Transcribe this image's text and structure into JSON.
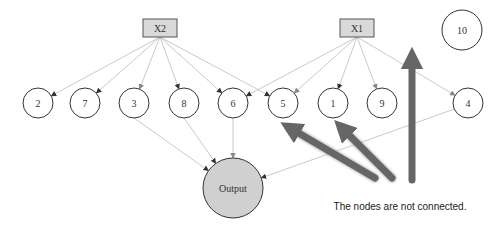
{
  "diagram": {
    "input_boxes": [
      {
        "id": "X2",
        "label": "X2",
        "x": 160,
        "y": 28
      },
      {
        "id": "X1",
        "label": "X1",
        "x": 357,
        "y": 28
      }
    ],
    "nodes": [
      {
        "id": "2",
        "label": "2",
        "x": 38,
        "y": 103
      },
      {
        "id": "7",
        "label": "7",
        "x": 85,
        "y": 103
      },
      {
        "id": "3",
        "label": "3",
        "x": 134,
        "y": 103
      },
      {
        "id": "8",
        "label": "8",
        "x": 184,
        "y": 103
      },
      {
        "id": "6",
        "label": "6",
        "x": 233,
        "y": 103
      },
      {
        "id": "5",
        "label": "5",
        "x": 283,
        "y": 103
      },
      {
        "id": "1",
        "label": "1",
        "x": 333,
        "y": 103
      },
      {
        "id": "9",
        "label": "9",
        "x": 382,
        "y": 103
      },
      {
        "id": "4",
        "label": "4",
        "x": 468,
        "y": 103
      },
      {
        "id": "10",
        "label": "10",
        "x": 462,
        "y": 30,
        "r": 20
      }
    ],
    "output": {
      "label": "Output",
      "x": 233,
      "y": 188,
      "r": 30
    },
    "edges": [
      {
        "from": "X2",
        "to": "2"
      },
      {
        "from": "X2",
        "to": "7"
      },
      {
        "from": "X2",
        "to": "3"
      },
      {
        "from": "X2",
        "to": "8"
      },
      {
        "from": "X2",
        "to": "6"
      },
      {
        "from": "X2",
        "to": "5"
      },
      {
        "from": "X1",
        "to": "6"
      },
      {
        "from": "X1",
        "to": "5"
      },
      {
        "from": "X1",
        "to": "1"
      },
      {
        "from": "X1",
        "to": "9"
      },
      {
        "from": "X1",
        "to": "4"
      },
      {
        "from": "3",
        "to": "Output"
      },
      {
        "from": "8",
        "to": "Output"
      },
      {
        "from": "6",
        "to": "Output"
      },
      {
        "from": "4",
        "to": "Output"
      }
    ],
    "annotation": {
      "text": "The nodes are not connected.",
      "x": 400,
      "y": 210,
      "arrow_color": "#666666",
      "arrows": [
        {
          "from": [
            375,
            178
          ],
          "to": [
            290,
            128
          ]
        },
        {
          "from": [
            392,
            178
          ],
          "to": [
            342,
            128
          ]
        },
        {
          "from": [
            412,
            180
          ],
          "to": [
            412,
            58
          ]
        }
      ]
    },
    "colors": {
      "box_fill": "#d9d9d9",
      "box_stroke": "#555555",
      "node_stroke": "#333333",
      "output_fill": "#d0d0d0",
      "edge": "#bbbbbb"
    }
  }
}
